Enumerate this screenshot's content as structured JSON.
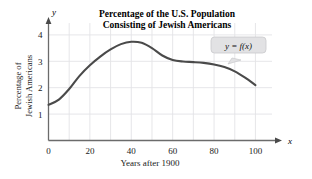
{
  "chart_data": {
    "type": "line",
    "title": "Percentage of the U.S. Population Consisting of Jewish Americans",
    "title_lines": [
      "Percentage of the U.S. Population",
      "Consisting of Jewish Americans"
    ],
    "xlabel": "Years after 1900",
    "ylabel": "Percentage of Jewish Americans",
    "ylabel_lines": [
      "Percentage of",
      "Jewish Americans"
    ],
    "x_axis_letter": "x",
    "y_axis_letter": "y",
    "xlim": [
      0,
      108
    ],
    "ylim": [
      0,
      4.45
    ],
    "xticks": [
      0,
      20,
      40,
      60,
      80,
      100
    ],
    "xtick_labels": [
      "0",
      "20",
      "40",
      "60",
      "80",
      "100"
    ],
    "yticks": [
      1,
      2,
      3,
      4
    ],
    "ytick_labels": [
      "1",
      "2",
      "3",
      "4"
    ],
    "grid": true,
    "grid_x_step": 10,
    "grid_y_step": 1,
    "legend_position": "none",
    "annotations": [
      {
        "name": "function-callout",
        "text": "y = f(x)",
        "points_to_x": 85,
        "points_to_y": 2.72
      }
    ],
    "series": [
      {
        "name": "Percentage of U.S. population that is Jewish American",
        "x": [
          0,
          5,
          10,
          15,
          20,
          25,
          30,
          35,
          40,
          45,
          50,
          55,
          60,
          65,
          70,
          75,
          80,
          85,
          90,
          95,
          100
        ],
        "y": [
          1.35,
          1.55,
          1.95,
          2.45,
          2.85,
          3.18,
          3.45,
          3.65,
          3.74,
          3.7,
          3.5,
          3.22,
          3.05,
          2.99,
          2.97,
          2.94,
          2.88,
          2.78,
          2.62,
          2.38,
          2.1
        ]
      }
    ],
    "colors": {
      "curve": "#4a4a4a",
      "axis": "#6b6b6b",
      "grid": "#e3e3e6",
      "callout_fill": "#e2e2e4",
      "callout_stroke": "#c9c9cc",
      "text": "#1a1a1a",
      "background": "#ffffff"
    }
  }
}
